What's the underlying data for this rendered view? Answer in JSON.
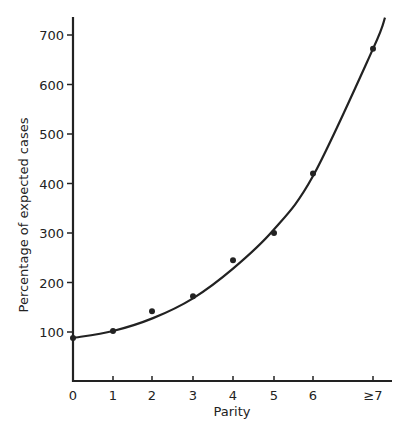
{
  "chart_data": {
    "type": "scatter",
    "title": "",
    "xlabel": "Parity",
    "ylabel": "Percentage of expected cases",
    "categories": [
      "0",
      "1",
      "2",
      "3",
      "4",
      "5",
      "6",
      "≥7"
    ],
    "x": [
      0,
      1,
      2,
      3,
      4,
      5,
      6,
      7.5
    ],
    "values": [
      88,
      102,
      142,
      172,
      245,
      300,
      420,
      672
    ],
    "fitted_curve": {
      "description": "smooth exponential-type fitted curve through points",
      "points": [
        [
          0,
          88
        ],
        [
          1,
          102
        ],
        [
          2,
          128
        ],
        [
          3,
          168
        ],
        [
          4,
          228
        ],
        [
          5,
          305
        ],
        [
          6,
          415
        ],
        [
          7.5,
          672
        ],
        [
          7.8,
          735
        ]
      ]
    },
    "yticks": [
      100,
      200,
      300,
      400,
      500,
      600,
      700
    ],
    "ylim": [
      0,
      740
    ],
    "xlim": [
      0,
      8
    ],
    "grid": false,
    "legend": null
  },
  "axes": {
    "x_label": "Parity",
    "y_label": "Percentage of expected cases",
    "x_tick_labels": [
      "0",
      "1",
      "2",
      "3",
      "4",
      "5",
      "6",
      "≥7"
    ],
    "y_tick_labels": [
      "100",
      "200",
      "300",
      "400",
      "500",
      "600",
      "700"
    ]
  },
  "colors": {
    "ink": "#222222",
    "background": "#ffffff"
  }
}
